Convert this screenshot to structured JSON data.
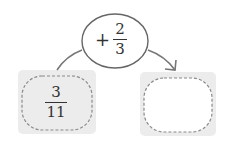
{
  "diagram": {
    "start_box": {
      "numerator": "3",
      "denominator": "11"
    },
    "operation": {
      "operator": "+",
      "numerator": "2",
      "denominator": "3"
    },
    "result_box": {
      "numerator": "",
      "denominator": ""
    },
    "colors": {
      "box_fill": "#ececec",
      "stroke": "#666666",
      "dash": "#8a8a8a",
      "text": "#333333"
    }
  }
}
